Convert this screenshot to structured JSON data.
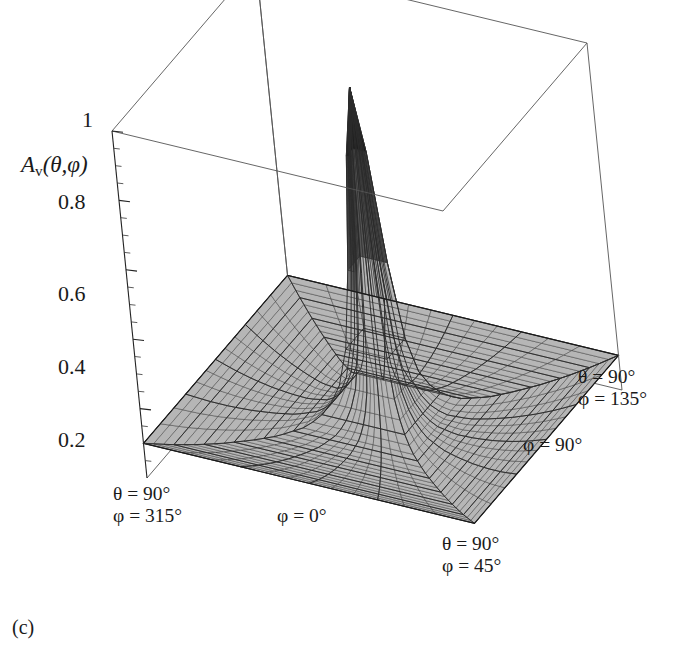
{
  "figure": {
    "caption": "(c)",
    "axis_title": {
      "symbol": "A",
      "subscript": "v",
      "args": "(θ,φ)",
      "full": "Aᵥ(θ,φ)"
    }
  },
  "z_axis": {
    "ticks": [
      "1",
      "0.8",
      "0.6",
      "0.4",
      "0.2"
    ],
    "values": [
      1,
      0.8,
      0.6,
      0.4,
      0.2
    ],
    "range": [
      0,
      1
    ],
    "minor_per_major": 4
  },
  "corner_labels": [
    {
      "name": "back-left",
      "theta": "θ = 90°",
      "phi": "φ = 315°"
    },
    {
      "name": "front-right",
      "theta": "θ = 90°",
      "phi": "φ = 45°"
    },
    {
      "name": "back-right",
      "theta": "θ = 90°",
      "phi": "φ = 135°"
    }
  ],
  "edge_labels": [
    {
      "name": "front-left-edge",
      "text": "φ = 0°"
    },
    {
      "name": "right-edge",
      "text": "φ = 90°"
    }
  ],
  "colors": {
    "surface_fill": "#b4b4b4",
    "mesh_line": "#2b2b2b",
    "frame_line": "#555555",
    "text": "#1a1a1a",
    "background": "#ffffff"
  },
  "chart_data": {
    "type": "surface",
    "title": "",
    "zlabel": "Aᵥ(θ,φ)",
    "xlabel": "φ = 0°",
    "ylabel": "φ = 90°",
    "zlim": [
      0,
      1
    ],
    "ztick_labels": [
      "0.2",
      "0.4",
      "0.6",
      "0.8",
      "1"
    ],
    "ztick_values": [
      0.2,
      0.4,
      0.6,
      0.8,
      1.0
    ],
    "grid": false,
    "legend": "none",
    "projection": "polar-azimuthal",
    "domain": {
      "theta_range_deg": [
        0,
        90
      ],
      "phi_range_deg": [
        0,
        360
      ],
      "base_corners_phi_deg": [
        45,
        135,
        225,
        315
      ]
    },
    "mesh": {
      "radial_divisions": 24,
      "angular_divisions": 48
    },
    "peak": {
      "value": 1.0,
      "theta_deg": 0,
      "phi_deg": 0
    },
    "profile_theta_deg": [
      0,
      2,
      4,
      6,
      8,
      10,
      12,
      15,
      20,
      25,
      30,
      40,
      50,
      60,
      70,
      80,
      90
    ],
    "profile_values": [
      1.0,
      0.93,
      0.79,
      0.61,
      0.44,
      0.31,
      0.23,
      0.16,
      0.1,
      0.075,
      0.06,
      0.05,
      0.052,
      0.058,
      0.068,
      0.082,
      0.1
    ]
  }
}
